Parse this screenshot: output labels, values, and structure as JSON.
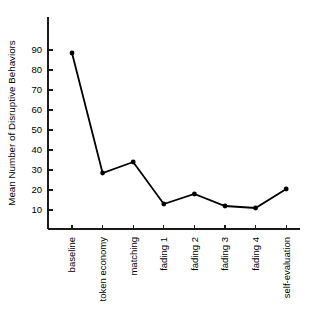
{
  "chart_data": {
    "type": "line",
    "title": "",
    "subtitle": "",
    "xlabel": "",
    "ylabel": "Mean Number of Disruptive Behaviors",
    "categories": [
      "baseline",
      "token economy",
      "matching",
      "fading 1",
      "fading 2",
      "fading 3",
      "fading 4",
      "self-evaluation"
    ],
    "values": [
      88.5,
      28.5,
      34,
      13,
      18,
      12,
      11,
      20.5
    ],
    "series": [
      {
        "name": "Mean Number of Disruptive Behaviors",
        "values": [
          88.5,
          28.5,
          34,
          13,
          18,
          12,
          11,
          20.5
        ]
      }
    ],
    "ylim": [
      0,
      95
    ],
    "yticks": [
      10,
      20,
      30,
      40,
      50,
      60,
      70,
      80,
      90
    ],
    "ytick_labels": [
      "10",
      "20",
      "30",
      "40",
      "50",
      "60",
      "70",
      "80",
      "90"
    ],
    "grid": false,
    "legend": false,
    "legend_position": "none",
    "marker": "circle",
    "line_color": "#000000",
    "marker_color": "#000000",
    "background_color": "#ffffff"
  }
}
